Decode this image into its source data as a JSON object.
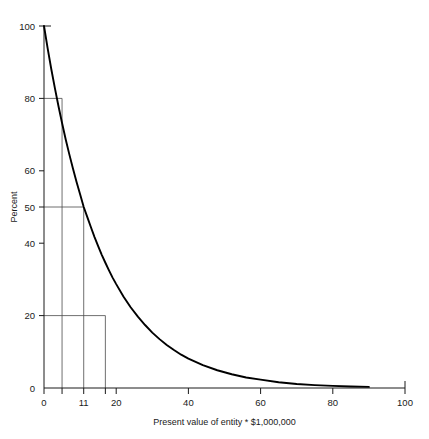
{
  "chart_data": {
    "type": "line",
    "title": "",
    "xlabel": "Present value of entity * $1,000,000",
    "ylabel": "Percent",
    "xlim": [
      0,
      100
    ],
    "ylim": [
      0,
      100
    ],
    "grid": false,
    "legend": null,
    "curve_label": "exponential-decay-curve",
    "xticks": [
      0,
      11,
      20,
      40,
      60,
      80,
      100
    ],
    "xtick_labels": [
      "0",
      "11",
      "20",
      "40",
      "60",
      "80",
      "100"
    ],
    "xticks_minor": [
      5,
      17
    ],
    "yticks": [
      0,
      20,
      40,
      50,
      60,
      80,
      100
    ],
    "ytick_labels": [
      "0",
      "20",
      "40",
      "50",
      "60",
      "80",
      "100"
    ],
    "reference_lines": [
      {
        "name": "80-percent-reference",
        "percent": 80,
        "x": 5
      },
      {
        "name": "50-percent-reference",
        "percent": 50,
        "x": 11
      },
      {
        "name": "20-percent-reference",
        "percent": 20,
        "x": 17
      }
    ],
    "x": [
      0,
      1,
      2,
      3,
      4,
      5,
      6,
      7,
      8,
      9,
      10,
      11,
      12,
      13,
      14,
      15,
      16,
      17,
      18,
      19,
      20,
      22,
      24,
      26,
      28,
      30,
      32,
      34,
      36,
      38,
      40,
      44,
      48,
      52,
      56,
      60,
      65,
      70,
      75,
      80,
      85,
      90
    ],
    "values": [
      100.0,
      93.9,
      88.2,
      82.9,
      77.9,
      73.2,
      68.7,
      64.6,
      60.7,
      57.0,
      53.5,
      50.0,
      47.2,
      44.4,
      41.7,
      39.2,
      36.8,
      34.6,
      32.5,
      30.5,
      28.7,
      25.3,
      22.3,
      19.7,
      17.4,
      15.3,
      13.5,
      11.9,
      10.5,
      9.2,
      8.1,
      6.3,
      4.9,
      3.8,
      2.9,
      2.3,
      1.6,
      1.1,
      0.8,
      0.6,
      0.4,
      0.3
    ]
  }
}
